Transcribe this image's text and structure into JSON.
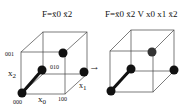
{
  "left_cube": {
    "formula": {
      "prefix": "F=",
      "terms": "x0 x2 (both negated)",
      "display": "F=x̄0 x̄2"
    },
    "vertex_labels": {
      "v000": "000",
      "v001": "001",
      "v010": "010",
      "v100": "100"
    },
    "axis_labels": {
      "x0": "x",
      "x0_sub": "0",
      "x1": "x",
      "x1_sub": "1",
      "x2": "x",
      "x2_sub": "2"
    }
  },
  "right_cube": {
    "formula": {
      "display": "F=x̄0 x̄2 V x0 x1 x̄2"
    }
  },
  "arrow": {
    "symbol": "→"
  },
  "colors": {
    "line": "#333333",
    "node": "#111111",
    "edge_thick": "#111111"
  }
}
